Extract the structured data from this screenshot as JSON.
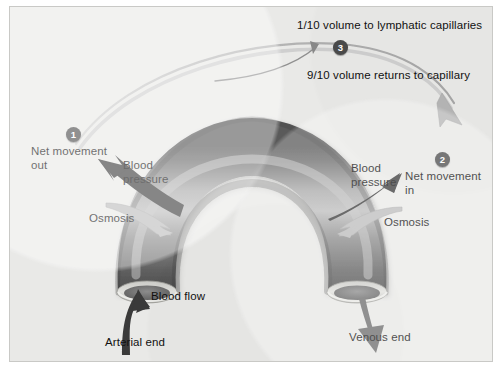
{
  "figure": {
    "background_color": "#e9e9e7",
    "border_color": "#c9c9c6"
  },
  "diagram": {
    "vessel_name": "capillary-arch",
    "vessel_colors": {
      "dark": "#4f4f4f",
      "mid": "#7b7b7b",
      "highlight": "#bdbdbd",
      "rim": "#d9d9d6"
    },
    "arrow_colors": {
      "dark": "#3c3c3c",
      "light": "#b9b9b9"
    }
  },
  "markers": [
    {
      "id": "1",
      "label": "1",
      "meaning": "net-movement-out"
    },
    {
      "id": "2",
      "label": "2",
      "meaning": "net-movement-in"
    },
    {
      "id": "3",
      "label": "3",
      "meaning": "to-lymphatic-capillaries"
    }
  ],
  "labels": {
    "lymph_volume": "1/10 volume to lymphatic capillaries",
    "return_volume": "9/10 volume returns to capillary",
    "net_movement_out": "Net movement\nout",
    "net_movement_in": "Net movement\nin",
    "blood_pressure_left": "Blood\npressure",
    "blood_pressure_right": "Blood\npressure",
    "osmosis_left": "Osmosis",
    "osmosis_right": "Osmosis",
    "blood_flow": "Blood flow",
    "arterial_end": "Arterial end",
    "venous_end": "Venous end"
  }
}
